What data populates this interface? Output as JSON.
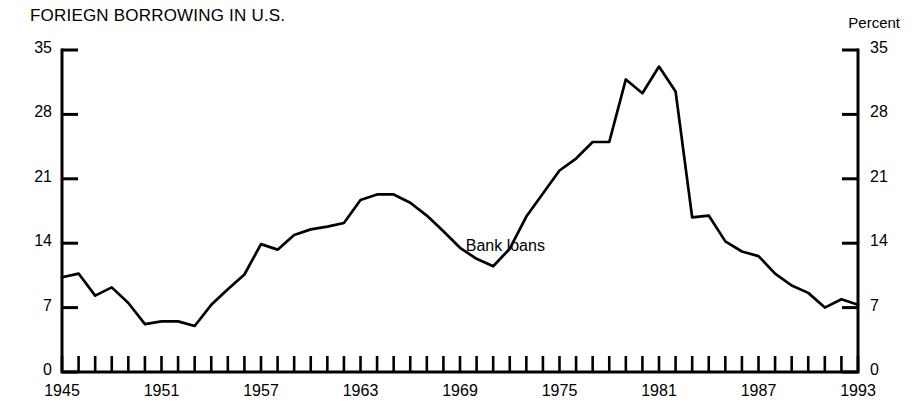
{
  "chart_data": {
    "type": "line",
    "title": "FORIEGN BORROWING IN U.S.",
    "xlabel": "",
    "ylabel": "",
    "unit_label": "Percent",
    "grid": false,
    "legend_position": "inline-annotation",
    "ylim": [
      0,
      35
    ],
    "xlim": [
      1945,
      1993
    ],
    "yticks": [
      0,
      7,
      14,
      21,
      28,
      35
    ],
    "ytick_labels_left": [
      "0",
      "7",
      "14",
      "21",
      "28",
      "35"
    ],
    "ytick_labels_right": [
      "0",
      "7",
      "14",
      "21",
      "28",
      "35"
    ],
    "xticks": [
      1945,
      1951,
      1957,
      1963,
      1969,
      1975,
      1981,
      1987,
      1993
    ],
    "xtick_labels": [
      "1945",
      "1951",
      "1957",
      "1963",
      "1969",
      "1975",
      "1981",
      "1987",
      "1993"
    ],
    "x": [
      1945,
      1946,
      1947,
      1948,
      1949,
      1950,
      1951,
      1952,
      1953,
      1954,
      1955,
      1956,
      1957,
      1958,
      1959,
      1960,
      1961,
      1962,
      1963,
      1964,
      1965,
      1966,
      1967,
      1968,
      1969,
      1970,
      1971,
      1972,
      1973,
      1974,
      1975,
      1976,
      1977,
      1978,
      1979,
      1980,
      1981,
      1982,
      1983,
      1984,
      1985,
      1986,
      1987,
      1988,
      1989,
      1990,
      1991,
      1992,
      1993
    ],
    "series": [
      {
        "name": "Bank loans",
        "color": "#000000",
        "values": [
          10.3,
          10.7,
          8.3,
          9.2,
          7.5,
          5.2,
          5.5,
          5.5,
          5.0,
          7.3,
          9.0,
          10.6,
          13.9,
          13.3,
          14.9,
          15.5,
          15.8,
          16.2,
          18.7,
          19.3,
          19.3,
          18.4,
          17.0,
          15.3,
          13.5,
          12.3,
          11.5,
          13.4,
          16.9,
          19.4,
          21.9,
          23.2,
          25.0,
          25.0,
          31.8,
          30.3,
          33.2,
          30.5,
          16.8,
          17.0,
          14.2,
          13.1,
          12.6,
          10.7,
          9.4,
          8.6,
          7.0,
          7.9,
          7.3
        ]
      }
    ],
    "annotations": [
      {
        "text": "Bank loans",
        "x": 1972,
        "y": 13.6
      }
    ]
  },
  "axis": {
    "unit_label": "Percent"
  }
}
